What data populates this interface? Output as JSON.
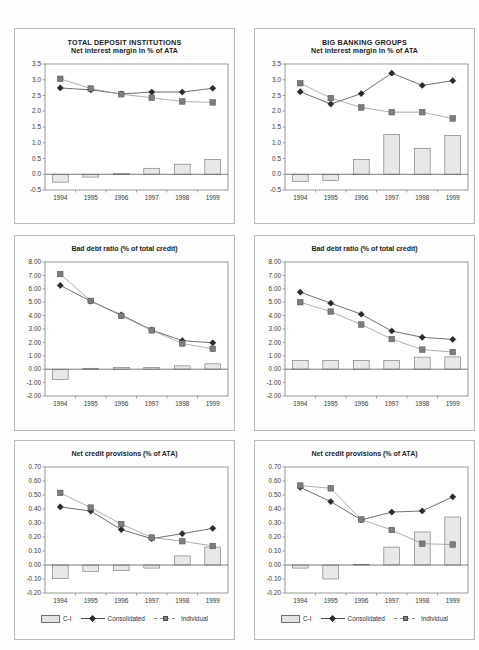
{
  "page": {
    "background": "#ffffff",
    "panel_border_color": "#b9b9b9"
  },
  "legend": {
    "bar_label": "C-I",
    "consolidated_label": "Consolidated",
    "individual_label": "Individual",
    "bar_color": "#e2e2e2",
    "consolidated_color": "#2b2b2b",
    "individual_color": "#7d7d7d"
  },
  "chart_data": [
    {
      "id": "total-deposit-institutions-nim",
      "type": "bar",
      "title": "TOTAL DEPOSIT INSTITUTIONS",
      "subtitle": "Net interest margin in % of ATA",
      "xlabel": "",
      "ylabel": "",
      "categories": [
        "1994",
        "1995",
        "1996",
        "1997",
        "1998",
        "1999"
      ],
      "yticks": [
        "3.5",
        "3.0",
        "2.5",
        "2.0",
        "1.5",
        "1.0",
        "0.5",
        "0.0",
        "-0.5"
      ],
      "ylim": [
        -0.5,
        3.5
      ],
      "grid": false,
      "legend_position": "none",
      "series": [
        {
          "name": "C-I",
          "type": "bar",
          "values": [
            -0.25,
            -0.09,
            0.02,
            0.19,
            0.32,
            0.47
          ]
        },
        {
          "name": "Consolidated",
          "type": "line",
          "values": [
            2.74,
            2.68,
            2.55,
            2.61,
            2.61,
            2.73
          ]
        },
        {
          "name": "Individual",
          "type": "line",
          "values": [
            3.03,
            2.72,
            2.54,
            2.43,
            2.31,
            2.28
          ]
        }
      ]
    },
    {
      "id": "big-banking-groups-nim",
      "type": "bar",
      "title": "BIG BANKING GROUPS",
      "subtitle": "Net interest margin in % of ATA",
      "xlabel": "",
      "ylabel": "",
      "categories": [
        "1994",
        "1995",
        "1996",
        "1997",
        "1998",
        "1999"
      ],
      "yticks": [
        "3.5",
        "3.0",
        "2.5",
        "2.0",
        "1.5",
        "1.0",
        "0.5",
        "0.0",
        "-0.5"
      ],
      "ylim": [
        -0.5,
        3.5
      ],
      "grid": false,
      "legend_position": "none",
      "series": [
        {
          "name": "C-I",
          "type": "bar",
          "values": [
            -0.23,
            -0.2,
            0.47,
            1.26,
            0.82,
            1.23
          ]
        },
        {
          "name": "Consolidated",
          "type": "line",
          "values": [
            2.62,
            2.23,
            2.56,
            3.21,
            2.82,
            2.97
          ]
        },
        {
          "name": "Individual",
          "type": "line",
          "values": [
            2.89,
            2.42,
            2.12,
            1.97,
            1.97,
            1.77
          ]
        }
      ]
    },
    {
      "id": "total-deposit-institutions-bad-debt",
      "type": "bar",
      "title": "Bad debt ratio (% of total credit)",
      "subtitle": "",
      "xlabel": "",
      "ylabel": "",
      "categories": [
        "1994",
        "1995",
        "1996",
        "1997",
        "1998",
        "1999"
      ],
      "yticks": [
        "8.00",
        "7.00",
        "6.00",
        "5.00",
        "4.00",
        "3.00",
        "2.00",
        "1.00",
        "0.00",
        "-1.00",
        "-2.00"
      ],
      "ylim": [
        -2.0,
        8.0
      ],
      "grid": false,
      "legend_position": "none",
      "series": [
        {
          "name": "C-I",
          "type": "bar",
          "values": [
            -0.78,
            0.07,
            0.13,
            0.14,
            0.25,
            0.4
          ]
        },
        {
          "name": "Consolidated",
          "type": "line",
          "values": [
            6.25,
            5.08,
            4.05,
            2.92,
            2.13,
            1.97
          ]
        },
        {
          "name": "Individual",
          "type": "line",
          "values": [
            7.1,
            5.1,
            3.98,
            2.9,
            1.92,
            1.52
          ]
        }
      ]
    },
    {
      "id": "big-banking-groups-bad-debt",
      "type": "bar",
      "title": "Bad debt ratio (% of total credit)",
      "subtitle": "",
      "xlabel": "",
      "ylabel": "",
      "categories": [
        "1994",
        "1995",
        "1996",
        "1997",
        "1998",
        "1999"
      ],
      "yticks": [
        "8.00",
        "7.00",
        "6.00",
        "5.00",
        "4.00",
        "3.00",
        "2.00",
        "1.00",
        "0.00",
        "-1.00",
        "-2.00"
      ],
      "ylim": [
        -2.0,
        8.0
      ],
      "grid": false,
      "legend_position": "none",
      "series": [
        {
          "name": "C-I",
          "type": "bar",
          "values": [
            0.65,
            0.65,
            0.66,
            0.66,
            0.9,
            0.92
          ]
        },
        {
          "name": "Consolidated",
          "type": "line",
          "values": [
            5.75,
            4.93,
            4.1,
            2.85,
            2.38,
            2.22
          ]
        },
        {
          "name": "Individual",
          "type": "line",
          "values": [
            5.0,
            4.3,
            3.33,
            2.25,
            1.46,
            1.28
          ]
        }
      ]
    },
    {
      "id": "total-deposit-institutions-provisions",
      "type": "bar",
      "title": "Net credit provisions (% of ATA)",
      "subtitle": "",
      "xlabel": "",
      "ylabel": "",
      "categories": [
        "1994",
        "1995",
        "1996",
        "1997",
        "1998",
        "1999"
      ],
      "yticks": [
        "0.70",
        "0.60",
        "0.50",
        "0.40",
        "0.30",
        "0.20",
        "0.10",
        "0.00",
        "-0.10",
        "-0.20"
      ],
      "ylim": [
        -0.2,
        0.7
      ],
      "grid": false,
      "legend_position": "bottom",
      "series": [
        {
          "name": "C-I",
          "type": "bar",
          "values": [
            -0.095,
            -0.045,
            -0.04,
            -0.022,
            0.065,
            0.128
          ]
        },
        {
          "name": "Consolidated",
          "type": "line",
          "values": [
            0.415,
            0.385,
            0.253,
            0.188,
            0.224,
            0.262
          ]
        },
        {
          "name": "Individual",
          "type": "line",
          "values": [
            0.515,
            0.41,
            0.292,
            0.196,
            0.17,
            0.136
          ]
        }
      ]
    },
    {
      "id": "big-banking-groups-provisions",
      "type": "bar",
      "title": "Net credit provisions (% of ATA)",
      "subtitle": "",
      "xlabel": "",
      "ylabel": "",
      "categories": [
        "1994",
        "1995",
        "1996",
        "1997",
        "1998",
        "1999"
      ],
      "yticks": [
        "0.70",
        "0.60",
        "0.50",
        "0.40",
        "0.30",
        "0.20",
        "0.10",
        "0.00",
        "-0.10",
        "-0.20"
      ],
      "ylim": [
        -0.2,
        0.7
      ],
      "grid": false,
      "legend_position": "bottom",
      "series": [
        {
          "name": "C-I",
          "type": "bar",
          "values": [
            -0.022,
            -0.1,
            0.005,
            0.128,
            0.236,
            0.343
          ]
        },
        {
          "name": "Consolidated",
          "type": "line",
          "values": [
            0.555,
            0.453,
            0.322,
            0.378,
            0.386,
            0.487
          ]
        },
        {
          "name": "Individual",
          "type": "line",
          "values": [
            0.567,
            0.548,
            0.325,
            0.25,
            0.152,
            0.146
          ]
        }
      ]
    }
  ]
}
